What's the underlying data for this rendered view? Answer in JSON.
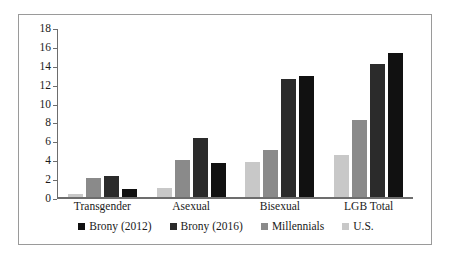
{
  "chart_data": {
    "type": "bar",
    "title": "",
    "xlabel": "",
    "ylabel": "",
    "ylim": [
      0,
      18
    ],
    "ytick_step": 2,
    "yticks": [
      18,
      16,
      14,
      12,
      10,
      8,
      6,
      4,
      2,
      0
    ],
    "grid": false,
    "legend_position": "bottom",
    "categories": [
      "Transgender",
      "Asexual",
      "Bisexual",
      "LGB Total"
    ],
    "series": [
      {
        "name": "Brony (2012)",
        "color": "#111111",
        "values": [
          0.9,
          3.6,
          13.0,
          15.4
        ]
      },
      {
        "name": "Brony (2016)",
        "color": "#2b2b2b",
        "values": [
          2.3,
          6.3,
          12.6,
          14.2
        ]
      },
      {
        "name": "Millennials",
        "color": "#8a8a8a",
        "values": [
          2.0,
          4.0,
          5.0,
          8.2
        ]
      },
      {
        "name": "U.S.",
        "color": "#c8c8c8",
        "values": [
          0.35,
          1.0,
          3.8,
          4.5
        ]
      }
    ],
    "bar_draw_order": [
      "U.S.",
      "Millennials",
      "Brony (2016)",
      "Brony (2012)"
    ]
  },
  "legend": {
    "items": [
      {
        "label": "Brony (2012)",
        "color": "#111111"
      },
      {
        "label": "Brony (2016)",
        "color": "#2b2b2b"
      },
      {
        "label": "Millennials",
        "color": "#8a8a8a"
      },
      {
        "label": "U.S.",
        "color": "#c8c8c8"
      }
    ]
  }
}
